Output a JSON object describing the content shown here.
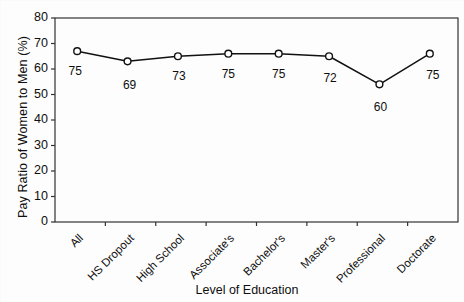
{
  "chart_data": {
    "type": "line",
    "title": "",
    "xlabel": "Level of Education",
    "ylabel": "Pay Ratio of Women to Men (%)",
    "categories": [
      "All",
      "HS Dropout",
      "High School",
      "Associate's",
      "Bachelor's",
      "Master's",
      "Professional",
      "Doctorate"
    ],
    "values": [
      67,
      63,
      65,
      66,
      66,
      65,
      54,
      66
    ],
    "point_labels": [
      "75",
      "69",
      "73",
      "75",
      "75",
      "72",
      "60",
      "75"
    ],
    "ylim": [
      0,
      80
    ],
    "yticks": [
      0,
      10,
      20,
      30,
      40,
      50,
      60,
      70,
      80
    ],
    "ytick_labels": [
      "0",
      "10",
      "20",
      "30",
      "40",
      "50",
      "60",
      "70",
      "80"
    ],
    "grid": false,
    "legend": false,
    "marker": "open-circle",
    "line_color": "#111111",
    "marker_face_color": "#ffffff",
    "marker_edge_color": "#111111",
    "axis_color": "#333333",
    "background_color": "#fdfdfd"
  },
  "axes": {
    "y_axis_title": "Pay Ratio of Women to Men (%)",
    "x_axis_title": "Level of Education"
  }
}
